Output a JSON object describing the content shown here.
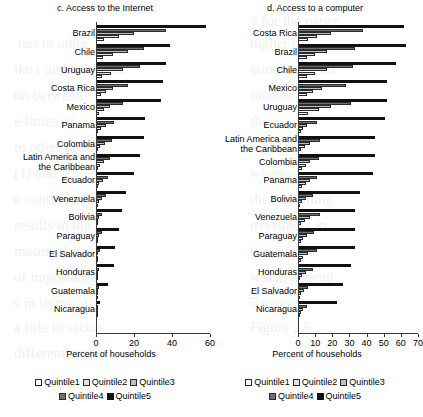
{
  "figure": {
    "axis_title": "Percent of households"
  },
  "legend": {
    "items": [
      {
        "label": "Quintile1",
        "key": "q1",
        "color": "#ffffff"
      },
      {
        "label": "Quintile2",
        "key": "q2",
        "color": "#e3e3e3"
      },
      {
        "label": "Quintile3",
        "key": "q3",
        "color": "#bdbdbd"
      },
      {
        "label": "Quintile4",
        "key": "q4",
        "color": "#6f6f6f"
      },
      {
        "label": "Quintile5",
        "key": "q5",
        "color": "#111111"
      }
    ]
  },
  "chart_data": [
    {
      "type": "bar",
      "orientation": "horizontal",
      "title": "c. Access to the Internet",
      "xlabel": "Percent of households",
      "ylabel": "",
      "xlim": [
        0,
        60
      ],
      "xticks": [
        0,
        20,
        40,
        60
      ],
      "grid": false,
      "legend_position": "bottom",
      "categories": [
        "Brazil",
        "Chile",
        "Uruguay",
        "Costa Rica",
        "Mexico",
        "Panama",
        "Colombia",
        "Latin America and\nthe Caribbean",
        "Ecuador",
        "Venezuela",
        "Bolivia",
        "Paraguay",
        "El Salvador",
        "Honduras",
        "Guatemala",
        "Nicaragua"
      ],
      "series": [
        {
          "name": "Quintile1",
          "values": [
            4.0,
            3.5,
            3.0,
            2.5,
            1.5,
            1.0,
            0.8,
            1.0,
            0.8,
            1.0,
            0.5,
            0.5,
            0.4,
            0.4,
            0.3,
            0.2
          ]
        },
        {
          "name": "Quintile2",
          "values": [
            12.0,
            9.0,
            8.0,
            5.5,
            4.0,
            2.5,
            2.0,
            2.0,
            1.5,
            1.5,
            0.8,
            1.0,
            0.6,
            0.6,
            0.5,
            0.3
          ]
        },
        {
          "name": "Quintile3",
          "values": [
            20.0,
            17.0,
            14.0,
            9.0,
            7.5,
            5.0,
            4.5,
            4.0,
            3.5,
            3.0,
            1.5,
            1.8,
            1.2,
            1.0,
            0.8,
            0.5
          ]
        },
        {
          "name": "Quintile4",
          "values": [
            37.0,
            25.0,
            23.0,
            17.0,
            14.0,
            9.5,
            8.5,
            7.5,
            6.5,
            5.5,
            3.0,
            3.0,
            2.0,
            1.8,
            1.5,
            0.8
          ]
        },
        {
          "name": "Quintile5",
          "values": [
            58.0,
            39.0,
            37.0,
            35.0,
            34.0,
            26.0,
            25.0,
            23.0,
            20.0,
            16.0,
            13.5,
            12.0,
            10.0,
            9.5,
            6.5,
            2.0
          ]
        }
      ]
    },
    {
      "type": "bar",
      "orientation": "horizontal",
      "title": "d. Access to a computer",
      "xlabel": "Percent of households",
      "ylabel": "",
      "xlim": [
        0,
        70
      ],
      "xticks": [
        0,
        10,
        20,
        30,
        40,
        50,
        60,
        70
      ],
      "grid": false,
      "legend_position": "bottom",
      "categories": [
        "Costa Rica",
        "Brazil",
        "Chile",
        "Mexico",
        "Uruguay",
        "Ecuador",
        "Latin America and\nthe Caribbean",
        "Colombia",
        "Panama",
        "Bolivia",
        "Venezuela",
        "Paraguay",
        "Guatemala",
        "Honduras",
        "El Salvador",
        "Nicaragua"
      ],
      "series": [
        {
          "name": "Quintile1",
          "values": [
            6.0,
            5.0,
            5.5,
            5.0,
            6.0,
            1.5,
            2.0,
            2.5,
            2.5,
            1.0,
            2.0,
            1.5,
            1.5,
            1.0,
            1.0,
            0.8
          ]
        },
        {
          "name": "Quintile2",
          "values": [
            11.0,
            10.0,
            10.0,
            9.0,
            12.0,
            3.0,
            4.0,
            4.5,
            4.5,
            2.5,
            4.0,
            3.0,
            3.0,
            2.5,
            2.0,
            1.5
          ]
        },
        {
          "name": "Quintile3",
          "values": [
            19.0,
            17.0,
            17.0,
            14.0,
            19.0,
            5.5,
            7.0,
            7.0,
            7.0,
            4.5,
            7.0,
            5.0,
            6.0,
            4.5,
            3.5,
            3.0
          ]
        },
        {
          "name": "Quintile4",
          "values": [
            38.0,
            33.0,
            32.0,
            28.0,
            31.0,
            11.0,
            13.0,
            12.0,
            11.0,
            9.0,
            13.0,
            9.5,
            11.0,
            9.0,
            6.0,
            5.0
          ]
        },
        {
          "name": "Quintile5",
          "values": [
            62.0,
            63.0,
            57.0,
            52.0,
            52.0,
            51.0,
            45.0,
            45.0,
            44.0,
            36.0,
            33.0,
            33.0,
            33.0,
            31.0,
            26.0,
            23.0
          ]
        }
      ]
    }
  ],
  "bleed_text": [
    {
      "t": "s for the paper",
      "x": 252,
      "y": 8
    },
    {
      "t": "ues to other",
      "x": 18,
      "y": 30
    },
    {
      "t": "ike r and nonlinear",
      "x": 14,
      "y": 56
    },
    {
      "t": "on between",
      "x": 14,
      "y": 82
    },
    {
      "t": "e limits of",
      "x": 14,
      "y": 108
    },
    {
      "t": "to other factors",
      "x": 14,
      "y": 134
    },
    {
      "t": "(1) and",
      "x": 14,
      "y": 160
    },
    {
      "t": "e continues to",
      "x": 14,
      "y": 186
    },
    {
      "t": "results in the",
      "x": 14,
      "y": 212
    },
    {
      "t": "mount of pos",
      "x": 14,
      "y": 238
    },
    {
      "t": "of importance",
      "x": 14,
      "y": 264
    },
    {
      "t": "s in terms of",
      "x": 14,
      "y": 290
    },
    {
      "t": "a role in sector",
      "x": 14,
      "y": 314
    },
    {
      "t": "different output",
      "x": 14,
      "y": 340
    },
    {
      "t": "higher in",
      "x": 250,
      "y": 30
    },
    {
      "t": "ountries. With",
      "x": 250,
      "y": 56
    },
    {
      "t": "income",
      "x": 250,
      "y": 82
    },
    {
      "t": "the",
      "x": 250,
      "y": 108
    },
    {
      "t": "is for the",
      "x": 250,
      "y": 134
    },
    {
      "t": "whereas",
      "x": 250,
      "y": 160
    },
    {
      "t": "the remaining",
      "x": 250,
      "y": 186
    },
    {
      "t": "nvestment in",
      "x": 250,
      "y": 212
    },
    {
      "t": "ther only in",
      "x": 250,
      "y": 238
    },
    {
      "t": "which depend",
      "x": 250,
      "y": 264
    },
    {
      "t": "5 percent",
      "x": 250,
      "y": 290
    },
    {
      "t": "Figure 2.6",
      "x": 250,
      "y": 314
    }
  ]
}
